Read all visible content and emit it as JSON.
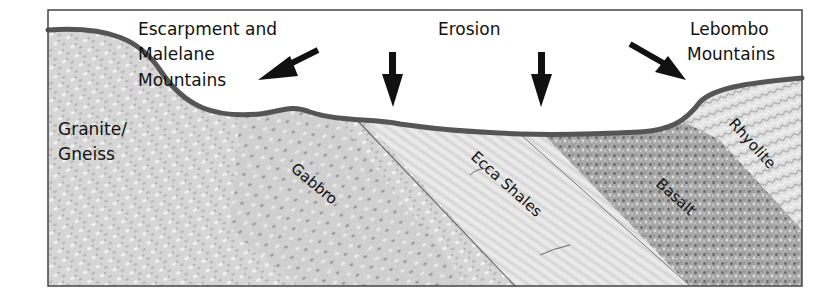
{
  "diagram": {
    "title_labels": {
      "escarpment_line1": "Escarpment and",
      "escarpment_line2": "Malelane",
      "escarpment_line3": "Mountains",
      "erosion": "Erosion",
      "lebombo_line1": "Lebombo",
      "lebombo_line2": "Mountains"
    },
    "rock_layers": [
      {
        "name": "Granite/",
        "name_line2": "Gneiss",
        "color": "#d4d4d4"
      },
      {
        "name": "Gabbro",
        "color": "#c9c9c9"
      },
      {
        "name": "Ecca Shales",
        "color": "#e3e3e3"
      },
      {
        "name": "Basalt",
        "color": "#a9a9a9"
      },
      {
        "name": "Rhyolite",
        "color": "#e0e0e0"
      }
    ],
    "colors": {
      "surface_line": "#555555",
      "frame": "#444444",
      "arrow": "#111111",
      "sky": "#ffffff"
    }
  }
}
